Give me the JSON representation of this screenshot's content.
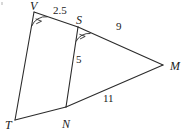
{
  "figure": {
    "background_color": "#ffffff",
    "stroke_color": "#2b2b2b",
    "text_color": "#1a1a1a",
    "vertices": [
      {
        "name": "V",
        "label": "V",
        "x": 34,
        "y": 12,
        "label_x": 30,
        "label_y": 0
      },
      {
        "name": "S",
        "label": "S",
        "x": 78,
        "y": 27,
        "label_x": 76,
        "label_y": 14
      },
      {
        "name": "M",
        "label": "M",
        "x": 163,
        "y": 65,
        "label_x": 170,
        "label_y": 60
      },
      {
        "name": "T",
        "label": "T",
        "x": 15,
        "y": 120,
        "label_x": 5,
        "label_y": 119
      },
      {
        "name": "N",
        "label": "N",
        "x": 66,
        "y": 107,
        "label_x": 62,
        "label_y": 118
      }
    ],
    "segments": [
      {
        "name": "segment-VS",
        "from": "V",
        "to": "S"
      },
      {
        "name": "segment-SM",
        "from": "S",
        "to": "M"
      },
      {
        "name": "segment-VT",
        "from": "V",
        "to": "T"
      },
      {
        "name": "segment-SN",
        "from": "S",
        "to": "N"
      },
      {
        "name": "segment-TN",
        "from": "T",
        "to": "N"
      },
      {
        "name": "segment-NM",
        "from": "N",
        "to": "M"
      }
    ],
    "length_labels": [
      {
        "name": "length-VS",
        "text": "2.5",
        "x": 53,
        "y": 5,
        "segment": "VS"
      },
      {
        "name": "length-SM",
        "text": "9",
        "x": 116,
        "y": 21,
        "segment": "SM"
      },
      {
        "name": "length-SN",
        "text": "5",
        "x": 76,
        "y": 54,
        "segment": "SN"
      },
      {
        "name": "length-NM",
        "text": "11",
        "x": 103,
        "y": 93,
        "segment": "NM"
      }
    ],
    "angle_marks": [
      {
        "name": "angle-mark-V",
        "at": "V",
        "note": "arc with tick at vertex V"
      },
      {
        "name": "angle-mark-S",
        "at": "S",
        "note": "arc with tick at vertex S"
      }
    ]
  }
}
